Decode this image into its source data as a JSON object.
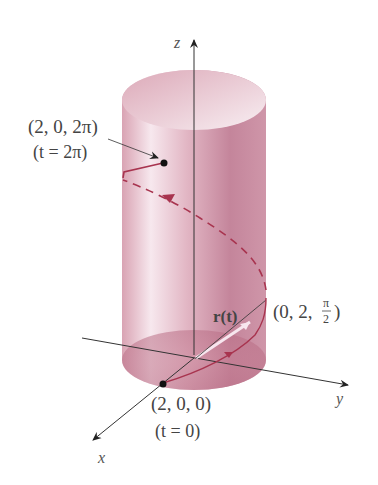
{
  "figure": {
    "type": "3D helix on cylinder",
    "colors": {
      "cylinder": "#d9a0b0",
      "cylinder_dark": "#b5677f",
      "cylinder_light": "#f6e6ec",
      "curve": "#a8344f",
      "axis": "#222222",
      "text": "#444444"
    }
  },
  "axes": {
    "x_label": "x",
    "y_label": "y",
    "z_label": "z"
  },
  "labels": {
    "top_point": "(2, 0, 2π)",
    "top_param": "(t = 2π)",
    "start_point": "(2, 0, 0)",
    "start_param": "(t = 0)",
    "mid_point_prefix": "(0, 2, ",
    "mid_point_num": "π",
    "mid_point_den": "2",
    "mid_point_suffix": ")",
    "vector": "r(t)"
  }
}
